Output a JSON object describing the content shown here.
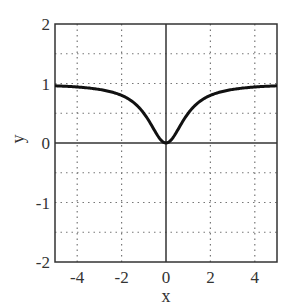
{
  "chart_data": {
    "type": "line",
    "title": "",
    "xlabel": "x",
    "ylabel": "y",
    "xlim": [
      -5,
      5
    ],
    "ylim": [
      -2,
      2
    ],
    "xticks": [
      -4,
      -2,
      0,
      2,
      4
    ],
    "yticks": [
      -2,
      -1,
      0,
      1,
      2
    ],
    "xtick_labels": [
      "-4",
      "-2",
      "0",
      "2",
      "4"
    ],
    "ytick_labels": [
      "-2",
      "-1",
      "0",
      "1",
      "2"
    ],
    "grid": true,
    "grid_style": "dotted",
    "x_minor_grid": [
      -4,
      -2,
      2,
      4
    ],
    "y_minor_grid": [
      -1.5,
      -1,
      -0.5,
      0.5,
      1,
      1.5
    ],
    "legend": null,
    "series": [
      {
        "name": "y = x^2/(1+x^2)",
        "x": [
          -5,
          -4.5,
          -4,
          -3.5,
          -3,
          -2.5,
          -2,
          -1.5,
          -1.25,
          -1,
          -0.75,
          -0.5,
          -0.25,
          0,
          0.25,
          0.5,
          0.75,
          1,
          1.25,
          1.5,
          2,
          2.5,
          3,
          3.5,
          4,
          4.5,
          5
        ],
        "values": [
          0.962,
          0.953,
          0.941,
          0.925,
          0.9,
          0.862,
          0.8,
          0.692,
          0.61,
          0.5,
          0.36,
          0.2,
          0.059,
          0,
          0.059,
          0.2,
          0.36,
          0.5,
          0.61,
          0.692,
          0.8,
          0.862,
          0.9,
          0.925,
          0.941,
          0.953,
          0.962
        ],
        "color": "#111111"
      }
    ]
  }
}
